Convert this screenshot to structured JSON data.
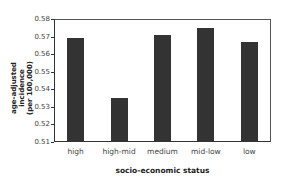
{
  "chart_data": {
    "type": "bar",
    "title": "",
    "xlabel": "socio-economic status",
    "ylabel": "age-adjusted incidence (per 100,000)",
    "ylabel_lines": [
      "age-adjusted incidence",
      "(per 100,000)"
    ],
    "categories": [
      "high",
      "high-mid",
      "medium",
      "mid-low",
      "low"
    ],
    "values": [
      0.569,
      0.535,
      0.571,
      0.575,
      0.567
    ],
    "ylim": [
      0.51,
      0.58
    ],
    "yticks": [
      "0.58",
      "0.57",
      "0.56",
      "0.55",
      "0.54",
      "0.53",
      "0.52",
      "0.51"
    ],
    "grid": false,
    "legend": null,
    "bar_color": "#333333"
  }
}
